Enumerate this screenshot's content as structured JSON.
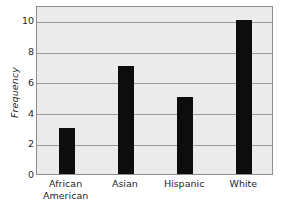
{
  "chart_data": {
    "type": "bar",
    "title": "",
    "xlabel": "",
    "ylabel": "Frequency",
    "categories": [
      "African American",
      "Asian",
      "Hispanic",
      "White"
    ],
    "category_lines": [
      [
        "African",
        "American"
      ],
      [
        "Asian"
      ],
      [
        "Hispanic"
      ],
      [
        "White"
      ]
    ],
    "values": [
      3,
      7,
      5,
      10
    ],
    "ylim": [
      0,
      11
    ],
    "yticks": [
      0,
      2,
      4,
      6,
      8,
      10
    ],
    "ytick_labels": [
      "0",
      "2",
      "4",
      "6",
      "8",
      "10"
    ],
    "grid": true,
    "grid_axis": "y",
    "legend": false,
    "legend_position": "none",
    "colors": {
      "bar": "#0d0d0d",
      "plot_background": "#ebebeb",
      "page_background": "#ffffff",
      "gridline": "#9a9a9a",
      "frame": "#8e8e8e",
      "text": "#1f1f1f"
    }
  }
}
